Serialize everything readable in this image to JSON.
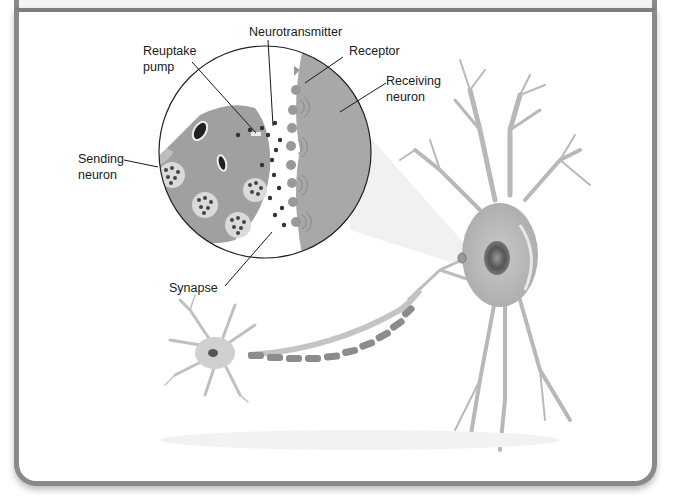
{
  "diagram": {
    "title": "",
    "labels": {
      "neurotransmitter": "Neurotransmitter",
      "reuptake_pump_line1": "Reuptake",
      "reuptake_pump_line2": "pump",
      "receptor": "Receptor",
      "receiving_neuron_line1": "Receiving",
      "receiving_neuron_line2": "neuron",
      "sending_neuron_line1": "Sending",
      "sending_neuron_line2": "neuron",
      "synapse": "Synapse"
    },
    "colors": {
      "frame": "#8a8a8a",
      "neuron_fill": "#b5b5b5",
      "neuron_dark": "#8f8f8f",
      "vesicle_fill": "#d9d9d9",
      "dot": "#333333",
      "line": "#1a1a1a"
    }
  }
}
